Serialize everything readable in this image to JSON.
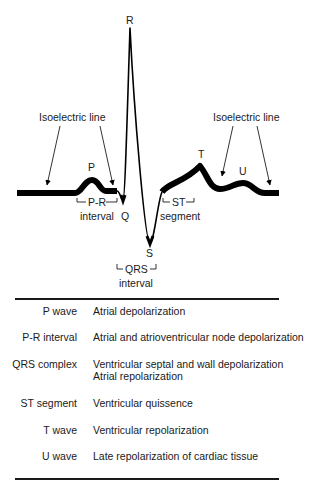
{
  "diagram": {
    "wave_labels": {
      "R": "R",
      "P": "P",
      "Q": "Q",
      "S": "S",
      "T": "T",
      "U": "U"
    },
    "annotations": {
      "isoelectric_left": "Isoelectric line",
      "isoelectric_right": "Isoelectric line",
      "pr_interval_line1": "P-R",
      "pr_interval_line2": "interval",
      "st_segment_line1": "ST",
      "st_segment_line2": "segment",
      "qrs_interval_line1": "QRS",
      "qrs_interval_line2": "interval"
    },
    "colors": {
      "trace": "#000000",
      "text": "#1a1a1a",
      "background": "#ffffff"
    }
  },
  "table": {
    "rows": [
      {
        "term": "P wave",
        "description": [
          "Atrial depolarization"
        ]
      },
      {
        "term": "P-R interval",
        "description": [
          "Atrial and atrioventricular node depolarization"
        ]
      },
      {
        "term": "QRS complex",
        "description": [
          "Ventricular septal and wall depolarization",
          "Atrial repolarization"
        ]
      },
      {
        "term": "ST segment",
        "description": [
          "Ventricular quissence"
        ]
      },
      {
        "term": "T wave",
        "description": [
          "Ventricular repolarization"
        ]
      },
      {
        "term": "U wave",
        "description": [
          "Late repolarization of cardiac tissue"
        ]
      }
    ]
  }
}
